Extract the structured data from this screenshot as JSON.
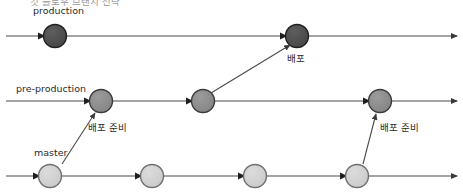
{
  "diagram": {
    "title_clipped": "깃 플로우 브랜치 전략",
    "width": 463,
    "height": 196,
    "background": "#ffffff",
    "line_color": "#4a4a4a",
    "text_color": "#2b2b2b",
    "lanes": [
      {
        "id": "production",
        "label": "production",
        "label_x": 33,
        "label_y": 14,
        "axis_y": 36,
        "axis_x1": 6,
        "axis_x2": 457,
        "node_fill": "#4e4e4e",
        "node_stroke": "#1f1f1f",
        "node_radius": 11,
        "nodes": [
          {
            "id": "prod-1",
            "cx": 55,
            "cy": 36,
            "label": "",
            "label_x": 0,
            "label_y": 0
          },
          {
            "id": "prod-2",
            "cx": 297,
            "cy": 36,
            "label": "배포",
            "label_x": 287,
            "label_y": 62
          }
        ]
      },
      {
        "id": "pre-production",
        "label": "pre-production",
        "label_x": 16,
        "label_y": 92,
        "axis_y": 101,
        "axis_x1": 6,
        "axis_x2": 457,
        "node_fill": "#8e8e8e",
        "node_stroke": "#3a3a3a",
        "node_radius": 11,
        "nodes": [
          {
            "id": "pre-1",
            "cx": 101,
            "cy": 101,
            "label": "배포 준비",
            "label_x": 88,
            "label_y": 131
          },
          {
            "id": "pre-2",
            "cx": 203,
            "cy": 101,
            "label": "",
            "label_x": 0,
            "label_y": 0
          },
          {
            "id": "pre-3",
            "cx": 380,
            "cy": 101,
            "label": "배포 준비",
            "label_x": 380,
            "label_y": 131
          }
        ]
      },
      {
        "id": "master",
        "label": "master",
        "label_x": 34,
        "label_y": 156,
        "axis_y": 176,
        "axis_x1": 6,
        "axis_x2": 457,
        "node_fill": "#d2d2d2",
        "node_stroke": "#6e6e6e",
        "node_radius": 11,
        "nodes": [
          {
            "id": "master-1",
            "cx": 50,
            "cy": 176,
            "label": "",
            "label_x": 0,
            "label_y": 0
          },
          {
            "id": "master-2",
            "cx": 152,
            "cy": 176,
            "label": "",
            "label_x": 0,
            "label_y": 0
          },
          {
            "id": "master-3",
            "cx": 255,
            "cy": 176,
            "label": "",
            "label_x": 0,
            "label_y": 0
          },
          {
            "id": "master-4",
            "cx": 357,
            "cy": 176,
            "label": "",
            "label_x": 0,
            "label_y": 0
          }
        ]
      }
    ],
    "merge_arrows": [
      {
        "id": "merge-master1-to-pre1",
        "x1": 62,
        "y1": 164,
        "x2": 95,
        "y2": 113
      },
      {
        "id": "merge-pre2-to-prod2",
        "x1": 211,
        "y1": 93,
        "x2": 290,
        "y2": 45
      },
      {
        "id": "merge-master4-to-pre3",
        "x1": 363,
        "y1": 164,
        "x2": 376,
        "y2": 114
      }
    ]
  }
}
